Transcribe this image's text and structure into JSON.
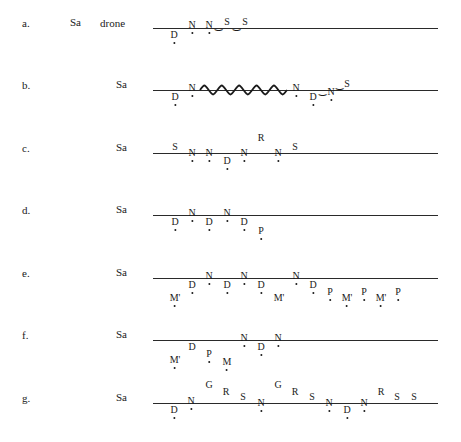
{
  "diagram": {
    "type": "tonal-contour-notation",
    "line_color": "#2a2a2a",
    "rows": [
      {
        "label": "a.",
        "sa": "Sa",
        "extra": "drone",
        "y": 28,
        "marks": [
          {
            "sym": "D",
            "x": 174,
            "dy": 8,
            "dot": true
          },
          {
            "sym": "N",
            "x": 192,
            "dy": -2,
            "dot": true
          },
          {
            "sym": "N",
            "x": 209,
            "dy": -2,
            "dot": true
          },
          {
            "sym": "‿",
            "x": 218,
            "dy": 0,
            "dot": false,
            "link": true
          },
          {
            "sym": "S",
            "x": 227,
            "dy": -5,
            "dot": false
          },
          {
            "sym": "‿",
            "x": 236,
            "dy": 0,
            "dot": false,
            "link": true
          },
          {
            "sym": "S",
            "x": 245,
            "dy": -5,
            "dot": false
          }
        ]
      },
      {
        "label": "b.",
        "sa": "Sa",
        "extra": "",
        "y": 90,
        "wave": {
          "x1": 200,
          "x2": 287,
          "cycles": 5
        },
        "marks": [
          {
            "sym": "D",
            "x": 175,
            "dy": 8,
            "dot": true
          },
          {
            "sym": "N",
            "x": 192,
            "dy": -1,
            "dot": true
          },
          {
            "sym": "N",
            "x": 296,
            "dy": -1,
            "dot": true
          },
          {
            "sym": "D",
            "x": 313,
            "dy": 8,
            "dot": true
          },
          {
            "sym": "‿",
            "x": 322,
            "dy": 3,
            "dot": false,
            "link": true
          },
          {
            "sym": "N",
            "x": 331,
            "dy": 3,
            "dot": true
          },
          {
            "sym": "‿",
            "x": 339,
            "dy": -3,
            "dot": false,
            "link": true
          },
          {
            "sym": "S",
            "x": 347,
            "dy": -5,
            "dot": false
          }
        ]
      },
      {
        "label": "c.",
        "sa": "Sa",
        "extra": "",
        "y": 153,
        "marks": [
          {
            "sym": "S",
            "x": 175,
            "dy": -5,
            "dot": false
          },
          {
            "sym": "N",
            "x": 192,
            "dy": 1,
            "dot": true
          },
          {
            "sym": "N",
            "x": 209,
            "dy": 1,
            "dot": true
          },
          {
            "sym": "D",
            "x": 227,
            "dy": 9,
            "dot": true
          },
          {
            "sym": "N",
            "x": 244,
            "dy": 1,
            "dot": true
          },
          {
            "sym": "R",
            "x": 261,
            "dy": -14,
            "dot": false
          },
          {
            "sym": "N",
            "x": 278,
            "dy": 1,
            "dot": true
          },
          {
            "sym": "S",
            "x": 295,
            "dy": -5,
            "dot": false
          }
        ]
      },
      {
        "label": "d.",
        "sa": "Sa",
        "extra": "",
        "y": 215,
        "marks": [
          {
            "sym": "D",
            "x": 175,
            "dy": 8,
            "dot": true
          },
          {
            "sym": "N",
            "x": 192,
            "dy": -1,
            "dot": true
          },
          {
            "sym": "D",
            "x": 209,
            "dy": 8,
            "dot": true
          },
          {
            "sym": "N",
            "x": 227,
            "dy": -1,
            "dot": true
          },
          {
            "sym": "D",
            "x": 244,
            "dy": 8,
            "dot": true
          },
          {
            "sym": "P",
            "x": 261,
            "dy": 17,
            "dot": true
          }
        ]
      },
      {
        "label": "e.",
        "sa": "Sa",
        "extra": "",
        "y": 278,
        "marks": [
          {
            "sym": "M'",
            "x": 175,
            "dy": 21,
            "dot": true
          },
          {
            "sym": "D",
            "x": 192,
            "dy": 8,
            "dot": true
          },
          {
            "sym": "N",
            "x": 209,
            "dy": -1,
            "dot": true
          },
          {
            "sym": "D",
            "x": 227,
            "dy": 8,
            "dot": true
          },
          {
            "sym": "N",
            "x": 244,
            "dy": -1,
            "dot": true
          },
          {
            "sym": "D",
            "x": 261,
            "dy": 8,
            "dot": true
          },
          {
            "sym": "M'",
            "x": 279,
            "dy": 21,
            "dot": false
          },
          {
            "sym": "N",
            "x": 296,
            "dy": -1,
            "dot": true
          },
          {
            "sym": "D",
            "x": 313,
            "dy": 8,
            "dot": true
          },
          {
            "sym": "P",
            "x": 330,
            "dy": 15,
            "dot": true
          },
          {
            "sym": "M'",
            "x": 347,
            "dy": 21,
            "dot": true
          },
          {
            "sym": "P",
            "x": 364,
            "dy": 15,
            "dot": true
          },
          {
            "sym": "M'",
            "x": 381,
            "dy": 21,
            "dot": true
          },
          {
            "sym": "P",
            "x": 398,
            "dy": 15,
            "dot": true
          }
        ]
      },
      {
        "label": "f.",
        "sa": "Sa",
        "extra": "",
        "y": 340,
        "marks": [
          {
            "sym": "M'",
            "x": 175,
            "dy": 21,
            "dot": true
          },
          {
            "sym": "D",
            "x": 192,
            "dy": 8,
            "dot": false
          },
          {
            "sym": "P",
            "x": 209,
            "dy": 15,
            "dot": true
          },
          {
            "sym": "M",
            "x": 227,
            "dy": 23,
            "dot": true
          },
          {
            "sym": "N",
            "x": 244,
            "dy": -1,
            "dot": true
          },
          {
            "sym": "D",
            "x": 261,
            "dy": 8,
            "dot": true
          },
          {
            "sym": "N",
            "x": 278,
            "dy": -1,
            "dot": true
          }
        ]
      },
      {
        "label": "g.",
        "sa": "Sa",
        "extra": "",
        "y": 403,
        "marks": [
          {
            "sym": "D",
            "x": 174,
            "dy": 8,
            "dot": true
          },
          {
            "sym": "N",
            "x": 191,
            "dy": -1,
            "dot": true
          },
          {
            "sym": "G",
            "x": 209,
            "dy": -17,
            "dot": false
          },
          {
            "sym": "R",
            "x": 226,
            "dy": -10,
            "dot": false
          },
          {
            "sym": "S",
            "x": 243,
            "dy": -5,
            "dot": false
          },
          {
            "sym": "N",
            "x": 261,
            "dy": 1,
            "dot": true
          },
          {
            "sym": "G",
            "x": 278,
            "dy": -17,
            "dot": false
          },
          {
            "sym": "R",
            "x": 295,
            "dy": -10,
            "dot": false
          },
          {
            "sym": "S",
            "x": 312,
            "dy": -5,
            "dot": false
          },
          {
            "sym": "N",
            "x": 329,
            "dy": 1,
            "dot": true
          },
          {
            "sym": "D",
            "x": 347,
            "dy": 8,
            "dot": true
          },
          {
            "sym": "N",
            "x": 364,
            "dy": 1,
            "dot": true
          },
          {
            "sym": "R",
            "x": 381,
            "dy": -10,
            "dot": false
          },
          {
            "sym": "S",
            "x": 397,
            "dy": -5,
            "dot": false
          },
          {
            "sym": "S",
            "x": 414,
            "dy": -5,
            "dot": false
          }
        ]
      }
    ]
  }
}
